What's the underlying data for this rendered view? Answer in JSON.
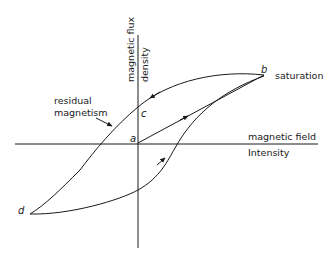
{
  "diagram": {
    "axes": {
      "y_label_line1": "magnetic flux",
      "y_label_line2": "density",
      "x_label_line1": "magnetic field",
      "x_label_line2": "Intensity"
    },
    "points": {
      "a": "a",
      "b": "b",
      "c": "c",
      "d": "d"
    },
    "annotations": {
      "saturation": "saturation",
      "residual_line1": "residual",
      "residual_line2": "magnetism"
    },
    "colors": {
      "line": "#1a1a1a",
      "background": "#ffffff"
    }
  }
}
